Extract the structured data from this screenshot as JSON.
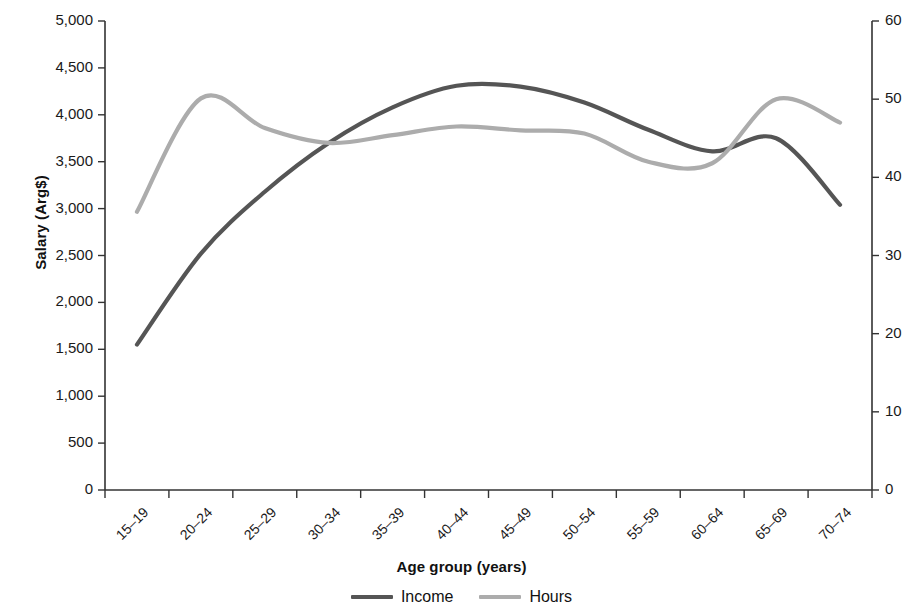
{
  "chart_data": {
    "type": "line",
    "title": "",
    "xlabel": "Age group (years)",
    "ylabel": "Salary (Arg$)",
    "y2label": "",
    "categories": [
      "15–19",
      "20–24",
      "25–29",
      "30–34",
      "35–39",
      "40–44",
      "45–49",
      "50–54",
      "55–59",
      "60–64",
      "65–69",
      "70–74"
    ],
    "ylim": [
      0,
      5000
    ],
    "y2lim": [
      0,
      60
    ],
    "yticks": [
      "0",
      "500",
      "1,000",
      "1,500",
      "2,000",
      "2,500",
      "3,000",
      "3,500",
      "4,000",
      "4,500",
      "5,000"
    ],
    "ytick_values": [
      0,
      500,
      1000,
      1500,
      2000,
      2500,
      3000,
      3500,
      4000,
      4500,
      5000
    ],
    "y2ticks": [
      "0",
      "10",
      "20",
      "30",
      "40",
      "50",
      "60"
    ],
    "y2tick_values": [
      0,
      10,
      20,
      30,
      40,
      50,
      60
    ],
    "grid": false,
    "legend_position": "bottom",
    "series": [
      {
        "name": "Income",
        "axis": "left",
        "color": "#555555",
        "values": [
          1550,
          2520,
          3180,
          3700,
          4080,
          4310,
          4300,
          4130,
          3840,
          3610,
          3750,
          3040
        ]
      },
      {
        "name": "Hours",
        "axis": "right",
        "color": "#acacac",
        "values": [
          35.6,
          50.1,
          46.3,
          44.4,
          45.4,
          46.5,
          46.0,
          45.6,
          42.0,
          41.8,
          50.0,
          47.0
        ]
      }
    ]
  },
  "axes": {
    "x_title": "Age group (years)",
    "y_title": "Salary (Arg$)"
  },
  "legend": {
    "items": [
      {
        "label": "Income",
        "color": "#555555"
      },
      {
        "label": "Hours",
        "color": "#acacac"
      }
    ]
  }
}
